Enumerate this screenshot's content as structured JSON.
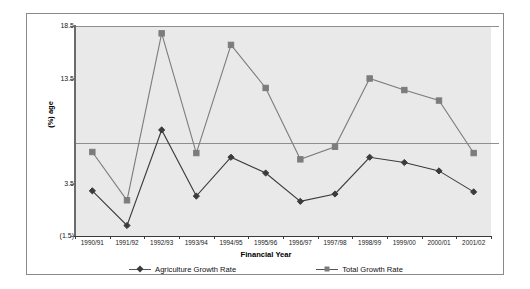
{
  "chart_data": {
    "type": "line",
    "title": "",
    "xlabel": "Financial Year",
    "ylabel": "(%) age",
    "categories": [
      "1990/91",
      "1991/92",
      "1992/93",
      "1993/94",
      "1994/95",
      "1995/96",
      "1996/97",
      "1997/98",
      "1998/99",
      "1999/00",
      "2000/01",
      "2001/02"
    ],
    "series": [
      {
        "name": "Agriculture Growth Rate",
        "marker": "diamond",
        "color": "#3b3b3b",
        "values": [
          2.8,
          -0.5,
          8.6,
          2.3,
          6.0,
          4.5,
          1.8,
          2.5,
          6.0,
          5.5,
          4.7,
          2.7
        ]
      },
      {
        "name": "Total Growth Rate",
        "marker": "square",
        "color": "#7c7c7c",
        "values": [
          6.5,
          1.9,
          17.8,
          6.4,
          16.7,
          12.6,
          5.8,
          7.0,
          13.5,
          12.4,
          11.4,
          6.4
        ]
      }
    ],
    "ytick_labels": [
      "18.5",
      "13.5",
      "8.5",
      "3.5",
      "(1.5)"
    ],
    "ytick_values": [
      18.5,
      13.5,
      8.5,
      3.5,
      -1.5
    ],
    "ytick_visible": [
      true,
      true,
      false,
      true,
      true
    ],
    "ylim": [
      -1.5,
      18.5
    ],
    "grid": true,
    "gridlines_at": [
      18.5,
      8.5
    ],
    "legend_position": "bottom",
    "plot_background": "#e9e9e9"
  },
  "legend": {
    "items": [
      {
        "label": "Agriculture Growth Rate"
      },
      {
        "label": "Total Growth Rate"
      }
    ]
  },
  "axes": {
    "x_title": "Financial Year",
    "y_title": "(%) age"
  }
}
